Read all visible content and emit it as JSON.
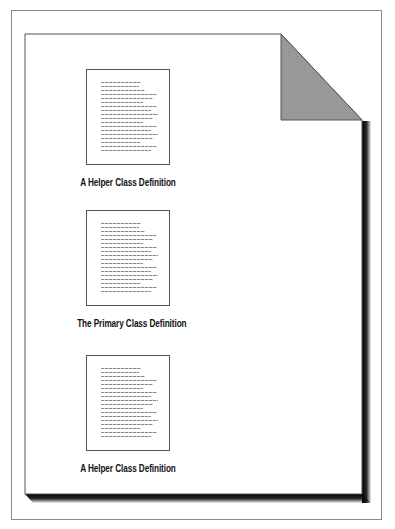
{
  "figure": {
    "type": "document-structure-diagram",
    "page": {
      "style": "sheet with folded top-right corner and drop shadow",
      "fold_color": "#9a9a9a",
      "shadow_color": "#000000"
    },
    "sections": [
      {
        "caption": "A Helper Class Definition",
        "line_count": 18
      },
      {
        "caption": "The Primary Class Definition",
        "line_count": 18
      },
      {
        "caption": "A Helper Class Definition",
        "line_count": 18
      }
    ]
  }
}
